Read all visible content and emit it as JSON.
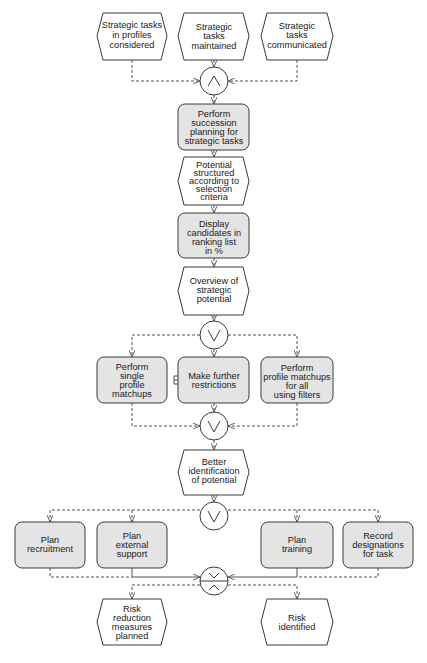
{
  "diagram": {
    "type": "EPC (event-driven process chain)",
    "colors": {
      "function_fill": "#e4e4e4",
      "event_fill": "#ffffff",
      "stroke": "#3a3a3a"
    },
    "events": {
      "e1": {
        "lines": [
          "Strategic tasks",
          "in profiles",
          "considered"
        ]
      },
      "e2": {
        "lines": [
          "Strategic",
          "tasks",
          "maintained"
        ]
      },
      "e3": {
        "lines": [
          "Strategic",
          "tasks",
          "communicated"
        ]
      },
      "e4": {
        "lines": [
          "Potential",
          "structured",
          "according to",
          "selection",
          "criteria"
        ]
      },
      "e5": {
        "lines": [
          "Overview of",
          "strategic",
          "potential"
        ]
      },
      "e6": {
        "lines": [
          "Better",
          "identification",
          "of potential"
        ]
      },
      "e7": {
        "lines": [
          "Risk",
          "reduction",
          "measures",
          "planned"
        ]
      },
      "e8": {
        "lines": [
          "Risk",
          "identified"
        ]
      }
    },
    "functions": {
      "f1": {
        "lines": [
          "Perform",
          "succession",
          "planning for",
          "strategic tasks"
        ]
      },
      "f2": {
        "lines": [
          "Display",
          "candidates in",
          "ranking list",
          "in %"
        ]
      },
      "f3": {
        "lines": [
          "Perform",
          "single",
          "profile",
          "matchups"
        ]
      },
      "f4": {
        "lines": [
          "Make further",
          "restrictions"
        ]
      },
      "f5": {
        "lines": [
          "Perform",
          "profile matchups",
          "for all",
          "using filters"
        ]
      },
      "f6": {
        "lines": [
          "Plan",
          "recruitment"
        ]
      },
      "f7": {
        "lines": [
          "Plan",
          "external",
          "support"
        ]
      },
      "f8": {
        "lines": [
          "Plan",
          "training"
        ]
      },
      "f9": {
        "lines": [
          "Record",
          "designations",
          "for task"
        ]
      }
    },
    "connectors": {
      "c1": {
        "operator": "AND",
        "glyph": "∧"
      },
      "c2": {
        "operator": "OR",
        "glyph": "∨"
      },
      "c3": {
        "operator": "OR",
        "glyph": "∨"
      },
      "c4": {
        "operator": "OR",
        "glyph": "∨"
      },
      "c5": {
        "operator": "XOR",
        "glyph": "×"
      }
    }
  }
}
